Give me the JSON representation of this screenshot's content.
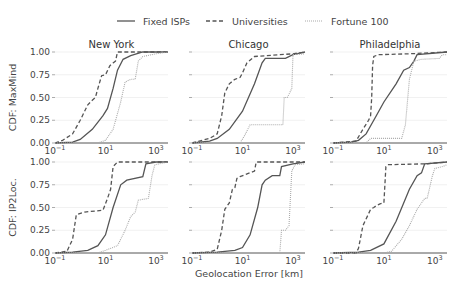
{
  "chart_data": {
    "type": "line",
    "title": "",
    "xlabel": "Geolocation Error [km]",
    "xscale": "log",
    "xlim": [
      0.1,
      3000
    ],
    "ylim": [
      0,
      1
    ],
    "x_ticks": [
      "10^-1",
      "10^1",
      "10^3"
    ],
    "y_ticks": [
      "0.00",
      "0.25",
      "0.50",
      "0.75",
      "1.00"
    ],
    "grid": true,
    "legend": {
      "position": "top",
      "entries": [
        {
          "name": "Fixed ISPs",
          "style": "solid",
          "color": "#555555"
        },
        {
          "name": "Universities",
          "style": "dashed",
          "color": "#555555"
        },
        {
          "name": "Fortune 100",
          "style": "dotted",
          "color": "#aaaaaa"
        }
      ]
    },
    "row_labels": [
      "CDF: MaxMind",
      "CDF: IP2Loc."
    ],
    "column_titles": [
      "New York",
      "Chicago",
      "Philadelphia"
    ],
    "panels": [
      {
        "row": 0,
        "col": 0,
        "title": "New York",
        "ylabel": "CDF: MaxMind",
        "series": [
          {
            "name": "Fixed ISPs",
            "points": [
              [
                0.1,
                0
              ],
              [
                0.5,
                0.01
              ],
              [
                1,
                0.04
              ],
              [
                3,
                0.15
              ],
              [
                8,
                0.3
              ],
              [
                12,
                0.38
              ],
              [
                20,
                0.6
              ],
              [
                30,
                0.8
              ],
              [
                50,
                0.92
              ],
              [
                100,
                0.96
              ],
              [
                300,
                1.0
              ],
              [
                3000,
                1.0
              ]
            ]
          },
          {
            "name": "Universities",
            "points": [
              [
                0.1,
                0
              ],
              [
                0.2,
                0.03
              ],
              [
                0.5,
                0.1
              ],
              [
                1,
                0.25
              ],
              [
                2,
                0.42
              ],
              [
                3,
                0.47
              ],
              [
                4,
                0.5
              ],
              [
                5,
                0.6
              ],
              [
                7,
                0.74
              ],
              [
                10,
                0.75
              ],
              [
                15,
                0.85
              ],
              [
                20,
                0.88
              ],
              [
                25,
                0.9
              ],
              [
                30,
                1.0
              ],
              [
                3000,
                1.0
              ]
            ]
          },
          {
            "name": "Fortune 100",
            "points": [
              [
                0.1,
                0
              ],
              [
                5,
                0
              ],
              [
                10,
                0.03
              ],
              [
                20,
                0.15
              ],
              [
                40,
                0.45
              ],
              [
                60,
                0.67
              ],
              [
                100,
                0.7
              ],
              [
                150,
                0.7
              ],
              [
                200,
                0.9
              ],
              [
                300,
                0.95
              ],
              [
                1000,
                0.98
              ],
              [
                3000,
                1.0
              ]
            ]
          }
        ]
      },
      {
        "row": 0,
        "col": 1,
        "title": "Chicago",
        "ylabel": "",
        "series": [
          {
            "name": "Fixed ISPs",
            "points": [
              [
                0.1,
                0
              ],
              [
                0.5,
                0.02
              ],
              [
                1,
                0.05
              ],
              [
                3,
                0.15
              ],
              [
                10,
                0.35
              ],
              [
                30,
                0.65
              ],
              [
                60,
                0.88
              ],
              [
                80,
                0.93
              ],
              [
                500,
                0.93
              ],
              [
                1000,
                0.97
              ],
              [
                3000,
                1.0
              ]
            ]
          },
          {
            "name": "Universities",
            "points": [
              [
                0.1,
                0
              ],
              [
                0.5,
                0.05
              ],
              [
                1,
                0.1
              ],
              [
                1.5,
                0.3
              ],
              [
                2,
                0.55
              ],
              [
                3,
                0.65
              ],
              [
                5,
                0.7
              ],
              [
                8,
                0.72
              ],
              [
                10,
                0.77
              ],
              [
                15,
                0.88
              ],
              [
                30,
                0.95
              ],
              [
                1000,
                0.98
              ],
              [
                3000,
                1.0
              ]
            ]
          },
          {
            "name": "Fortune 100",
            "points": [
              [
                0.1,
                0
              ],
              [
                8,
                0
              ],
              [
                12,
                0.08
              ],
              [
                20,
                0.2
              ],
              [
                400,
                0.2
              ],
              [
                450,
                0.5
              ],
              [
                600,
                0.5
              ],
              [
                900,
                0.6
              ],
              [
                1000,
                0.97
              ],
              [
                3000,
                0.98
              ]
            ]
          }
        ]
      },
      {
        "row": 0,
        "col": 2,
        "title": "Philadelphia",
        "ylabel": "",
        "series": [
          {
            "name": "Fixed ISPs",
            "points": [
              [
                0.1,
                0
              ],
              [
                0.5,
                0.01
              ],
              [
                1,
                0.03
              ],
              [
                2,
                0.1
              ],
              [
                5,
                0.3
              ],
              [
                10,
                0.45
              ],
              [
                30,
                0.65
              ],
              [
                60,
                0.8
              ],
              [
                100,
                0.83
              ],
              [
                150,
                0.9
              ],
              [
                200,
                0.97
              ],
              [
                3000,
                1.0
              ]
            ]
          },
          {
            "name": "Universities",
            "points": [
              [
                0.1,
                0
              ],
              [
                0.8,
                0.02
              ],
              [
                1.5,
                0.15
              ],
              [
                2.5,
                0.25
              ],
              [
                3,
                0.3
              ],
              [
                3.3,
                0.5
              ],
              [
                3.6,
                0.85
              ],
              [
                4,
                0.95
              ],
              [
                6,
                0.97
              ],
              [
                100,
                0.98
              ],
              [
                3000,
                1.0
              ]
            ]
          },
          {
            "name": "Fortune 100",
            "points": [
              [
                0.1,
                0
              ],
              [
                2,
                0
              ],
              [
                3,
                0.05
              ],
              [
                50,
                0.05
              ],
              [
                70,
                0.2
              ],
              [
                100,
                0.7
              ],
              [
                150,
                0.9
              ],
              [
                300,
                0.92
              ],
              [
                1500,
                0.93
              ],
              [
                2000,
                0.97
              ],
              [
                3000,
                0.97
              ]
            ]
          }
        ]
      },
      {
        "row": 1,
        "col": 0,
        "title": "",
        "ylabel": "CDF: IP2Loc.",
        "series": [
          {
            "name": "Fixed ISPs",
            "points": [
              [
                0.1,
                0
              ],
              [
                0.5,
                0.01
              ],
              [
                2,
                0.03
              ],
              [
                5,
                0.08
              ],
              [
                10,
                0.2
              ],
              [
                20,
                0.5
              ],
              [
                40,
                0.75
              ],
              [
                70,
                0.8
              ],
              [
                300,
                0.84
              ],
              [
                400,
                0.98
              ],
              [
                1000,
                1.0
              ],
              [
                3000,
                1.0
              ]
            ]
          },
          {
            "name": "Universities",
            "points": [
              [
                0.1,
                0
              ],
              [
                0.3,
                0.02
              ],
              [
                0.5,
                0.15
              ],
              [
                0.7,
                0.42
              ],
              [
                1.5,
                0.45
              ],
              [
                8,
                0.47
              ],
              [
                12,
                0.6
              ],
              [
                16,
                0.7
              ],
              [
                20,
                0.95
              ],
              [
                30,
                1.0
              ],
              [
                3000,
                1.0
              ]
            ]
          },
          {
            "name": "Fortune 100",
            "points": [
              [
                0.1,
                0
              ],
              [
                5,
                0
              ],
              [
                10,
                0.03
              ],
              [
                30,
                0.08
              ],
              [
                60,
                0.25
              ],
              [
                100,
                0.4
              ],
              [
                150,
                0.45
              ],
              [
                200,
                0.58
              ],
              [
                500,
                0.6
              ],
              [
                700,
                0.85
              ],
              [
                900,
                0.97
              ],
              [
                3000,
                1.0
              ]
            ]
          }
        ]
      },
      {
        "row": 1,
        "col": 1,
        "title": "",
        "ylabel": "",
        "series": [
          {
            "name": "Fixed ISPs",
            "points": [
              [
                0.1,
                0
              ],
              [
                1,
                0.01
              ],
              [
                5,
                0.03
              ],
              [
                10,
                0.06
              ],
              [
                20,
                0.2
              ],
              [
                40,
                0.5
              ],
              [
                60,
                0.75
              ],
              [
                80,
                0.8
              ],
              [
                150,
                0.85
              ],
              [
                300,
                0.85
              ],
              [
                350,
                0.95
              ],
              [
                1000,
                0.98
              ],
              [
                3000,
                1.0
              ]
            ]
          },
          {
            "name": "Universities",
            "points": [
              [
                0.1,
                0
              ],
              [
                0.5,
                0.01
              ],
              [
                1,
                0.04
              ],
              [
                1.5,
                0.25
              ],
              [
                2,
                0.48
              ],
              [
                3,
                0.55
              ],
              [
                4,
                0.7
              ],
              [
                5,
                0.72
              ],
              [
                6,
                0.82
              ],
              [
                8,
                0.84
              ],
              [
                30,
                0.9
              ],
              [
                35,
                1.0
              ],
              [
                3000,
                1.0
              ]
            ]
          },
          {
            "name": "Fortune 100",
            "points": [
              [
                0.1,
                0
              ],
              [
                300,
                0
              ],
              [
                350,
                0.25
              ],
              [
                500,
                0.25
              ],
              [
                700,
                0.3
              ],
              [
                900,
                0.9
              ],
              [
                1200,
                0.97
              ],
              [
                3000,
                0.98
              ]
            ]
          }
        ]
      },
      {
        "row": 1,
        "col": 2,
        "title": "",
        "ylabel": "",
        "series": [
          {
            "name": "Fixed ISPs",
            "points": [
              [
                0.1,
                0
              ],
              [
                1,
                0.01
              ],
              [
                3,
                0.03
              ],
              [
                10,
                0.1
              ],
              [
                30,
                0.35
              ],
              [
                100,
                0.7
              ],
              [
                200,
                0.85
              ],
              [
                300,
                0.88
              ],
              [
                400,
                0.98
              ],
              [
                3000,
                1.0
              ]
            ]
          },
          {
            "name": "Universities",
            "points": [
              [
                0.1,
                0
              ],
              [
                0.8,
                0
              ],
              [
                1,
                0.05
              ],
              [
                1.5,
                0.3
              ],
              [
                2.2,
                0.4
              ],
              [
                3,
                0.48
              ],
              [
                4,
                0.5
              ],
              [
                5,
                0.52
              ],
              [
                7,
                0.54
              ],
              [
                10,
                0.55
              ],
              [
                12,
                0.95
              ],
              [
                15,
                0.97
              ],
              [
                500,
                0.98
              ],
              [
                3000,
                1.0
              ]
            ]
          },
          {
            "name": "Fortune 100",
            "points": [
              [
                0.1,
                0
              ],
              [
                10,
                0
              ],
              [
                20,
                0.02
              ],
              [
                50,
                0.15
              ],
              [
                100,
                0.3
              ],
              [
                200,
                0.48
              ],
              [
                400,
                0.6
              ],
              [
                500,
                0.6
              ],
              [
                800,
                0.85
              ],
              [
                1000,
                0.93
              ],
              [
                2000,
                0.95
              ],
              [
                3000,
                0.97
              ]
            ]
          }
        ]
      }
    ]
  }
}
